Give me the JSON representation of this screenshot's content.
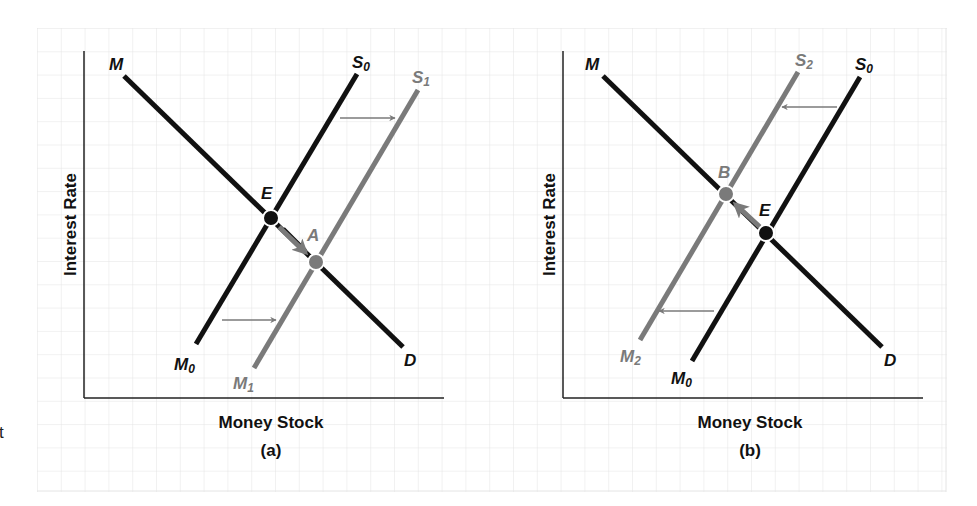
{
  "figure": {
    "colors": {
      "black": "#111111",
      "grey": "#7a7a7a",
      "grid": "#e6e6e6",
      "axis": "#222222",
      "background": "#ffffff"
    },
    "left_fragment": "t",
    "panels": [
      {
        "id": "a",
        "caption": "(a)",
        "x_axis_label": "Money Stock",
        "y_axis_label": "Interest Rate",
        "curves": [
          {
            "name": "demand",
            "label_start": "M",
            "label_end": "D",
            "color": "black"
          },
          {
            "name": "supply-initial",
            "label_start": "M",
            "label_start_sub": "0",
            "label_end": "S",
            "label_end_sub": "0",
            "color": "black"
          },
          {
            "name": "supply-shifted",
            "label_start": "M",
            "label_start_sub": "1",
            "label_end": "S",
            "label_end_sub": "1",
            "color": "grey"
          }
        ],
        "points": [
          {
            "label": "E",
            "color": "black"
          },
          {
            "label": "A",
            "color": "grey"
          }
        ],
        "shift_direction": "right"
      },
      {
        "id": "b",
        "caption": "(b)",
        "x_axis_label": "Money Stock",
        "y_axis_label": "Interest Rate",
        "curves": [
          {
            "name": "demand",
            "label_start": "M",
            "label_end": "D",
            "color": "black"
          },
          {
            "name": "supply-initial",
            "label_start": "M",
            "label_start_sub": "0",
            "label_end": "S",
            "label_end_sub": "0",
            "color": "black"
          },
          {
            "name": "supply-shifted",
            "label_start": "M",
            "label_start_sub": "2",
            "label_end": "S",
            "label_end_sub": "2",
            "color": "grey"
          }
        ],
        "points": [
          {
            "label": "B",
            "color": "grey"
          },
          {
            "label": "E",
            "color": "black"
          }
        ],
        "shift_direction": "left"
      }
    ]
  }
}
